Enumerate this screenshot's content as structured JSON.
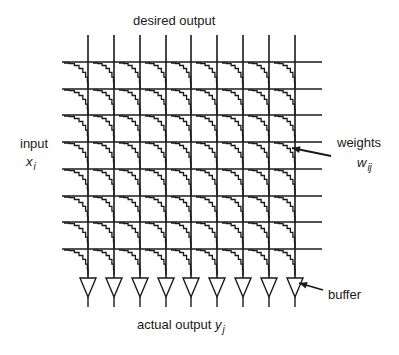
{
  "labels": {
    "top": "desired output",
    "input": "input",
    "input_var": "x",
    "input_sub": "i",
    "weights": "weights",
    "weights_var": "w",
    "weights_sub": "ij",
    "buffer": "buffer",
    "bottom": "actual output",
    "bottom_var": "y",
    "bottom_sub": "j"
  },
  "grid": {
    "columns_x": [
      88,
      114,
      140,
      166,
      191,
      217,
      243,
      269,
      295
    ],
    "rows_y": [
      62,
      89,
      115,
      142,
      169,
      196,
      222,
      249
    ],
    "h_line_start_x": 62,
    "h_line_end_x": 322,
    "v_line_top_y": 35,
    "v_line_bottom_y": 278,
    "cell_height": 27,
    "stroke_color": "#1a1a1a"
  },
  "buffers": {
    "top_y": 278,
    "tip_y": 297,
    "stem_end_y": 307,
    "half_width": 8
  },
  "arrows": {
    "weights": {
      "from": [
        331,
        156
      ],
      "to": [
        292,
        148
      ]
    },
    "buffer": {
      "from": [
        323,
        290
      ],
      "to": [
        299,
        283
      ]
    }
  }
}
